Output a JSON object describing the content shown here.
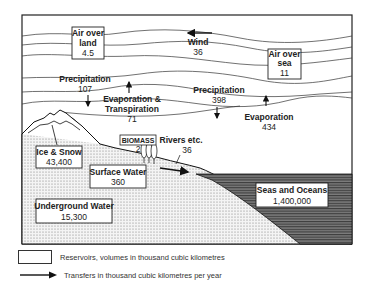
{
  "diagram": {
    "type": "water-cycle",
    "reservoirs": [
      {
        "id": "air_over_land",
        "line1": "Air over",
        "line2": "land",
        "value": "4.5"
      },
      {
        "id": "air_over_sea",
        "line1": "Air over",
        "line2": "sea",
        "value": "11"
      },
      {
        "id": "ice_snow",
        "line1": "Ice & Snow",
        "value": "43,400"
      },
      {
        "id": "biomass",
        "line1": "BIOMASS",
        "value": "2"
      },
      {
        "id": "surface_water",
        "line1": "Surface Water",
        "value": "360"
      },
      {
        "id": "underground_water",
        "line1": "Underground Water",
        "value": "15,300"
      },
      {
        "id": "seas_oceans",
        "line1": "Seas and Oceans",
        "value": "1,400,000"
      }
    ],
    "transfers": [
      {
        "id": "wind",
        "label": "Wind",
        "value": "36"
      },
      {
        "id": "precip_land",
        "label": "Precipitation",
        "value": "107"
      },
      {
        "id": "evapotranspiration",
        "line1": "Evaporation &",
        "line2": "Transpiration",
        "value": "71"
      },
      {
        "id": "precip_sea",
        "label": "Precipitation",
        "value": "398"
      },
      {
        "id": "evaporation_sea",
        "label": "Evaporation",
        "value": "434"
      },
      {
        "id": "rivers",
        "label": "Rivers etc.",
        "value": "36"
      }
    ]
  },
  "legend": {
    "reservoirs": "Reservoirs, volumes in thousand cubic kilometres",
    "transfers": "Transfers in thousand cubic kilometres per year"
  }
}
